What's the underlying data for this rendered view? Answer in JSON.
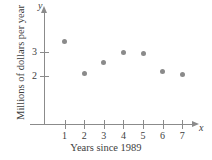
{
  "chart_data": {
    "type": "scatter",
    "title": "",
    "xlabel": "Years since 1989",
    "ylabel": "Millions of dollars per year",
    "x_axis_letter": "x",
    "y_axis_letter": "y",
    "xlim": [
      0,
      7.8
    ],
    "ylim": [
      0,
      3.9
    ],
    "xticks": [
      1,
      2,
      3,
      4,
      5,
      6,
      7
    ],
    "xtick_labels": [
      "1",
      "2",
      "3",
      "4",
      "5",
      "6",
      "7"
    ],
    "yticks": [
      2,
      3
    ],
    "ytick_labels": [
      "2",
      "3"
    ],
    "grid": false,
    "legend": null,
    "point_color": "#8a8a8a",
    "axis_color": "#8b8b8b",
    "text_color": "#3d3d3d",
    "x": [
      1,
      2,
      3,
      4,
      5,
      6,
      7
    ],
    "values": [
      3.45,
      2.1,
      2.55,
      3.0,
      2.95,
      2.2,
      2.05
    ],
    "points": [
      {
        "x": 1,
        "y": 3.45
      },
      {
        "x": 2,
        "y": 2.1
      },
      {
        "x": 3,
        "y": 2.55
      },
      {
        "x": 4,
        "y": 3.0
      },
      {
        "x": 5,
        "y": 2.95
      },
      {
        "x": 6,
        "y": 2.2
      },
      {
        "x": 7,
        "y": 2.05
      }
    ]
  }
}
